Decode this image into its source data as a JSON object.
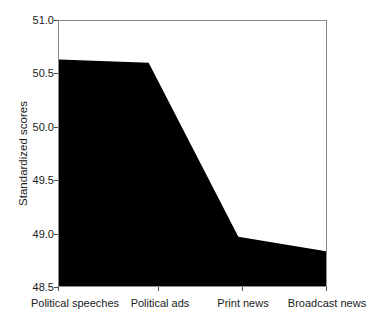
{
  "chart_data": {
    "type": "area",
    "title": "",
    "subtitle": "",
    "xlabel": "",
    "ylabel": "Standardized scores",
    "categories": [
      "Political speeches",
      "Political ads",
      "Print news",
      "Broadcast news"
    ],
    "values": [
      50.64,
      50.61,
      48.98,
      48.84
    ],
    "series": [
      {
        "name": "Standardized scores",
        "values": [
          50.64,
          50.61,
          48.98,
          48.84
        ]
      }
    ],
    "ylim": [
      48.5,
      51.0
    ],
    "ytick_labels": [
      "51.0",
      "50.5",
      "50.0",
      "49.5",
      "49.0",
      "48.5"
    ],
    "ytick_values": [
      51.0,
      50.5,
      50.0,
      49.5,
      49.0,
      48.5
    ],
    "grid": false,
    "legend": "none",
    "fill_color": "#000000",
    "axis_color": "#8a8a8a",
    "background_color": "#ffffff"
  },
  "axes": {
    "y_title": "Standardized scores"
  }
}
